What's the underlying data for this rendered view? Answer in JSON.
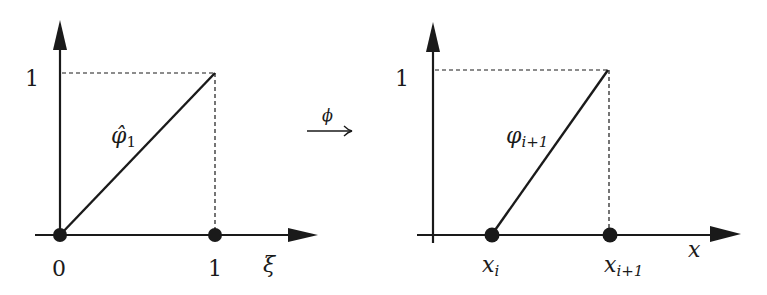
{
  "left_panel": {
    "y_tick": "1",
    "x_ticks": [
      "0",
      "1"
    ],
    "x_axis_label": "ξ",
    "function_label": "φ̂",
    "function_subscript": "1"
  },
  "mapping": {
    "label": "ϕ"
  },
  "right_panel": {
    "y_tick": "1",
    "x_ticks": [
      {
        "base": "x",
        "sub": "i"
      },
      {
        "base": "x",
        "sub": "i+1"
      }
    ],
    "x_axis_label": "x",
    "function_label": "φ",
    "function_subscript": "i+1"
  },
  "colors": {
    "ink": "#1a1a1a",
    "background": "#ffffff"
  }
}
